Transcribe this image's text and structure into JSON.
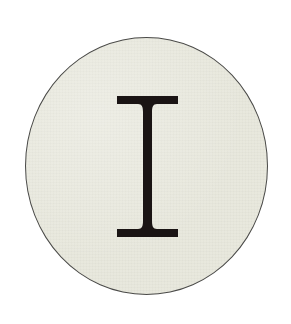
{
  "emblem": {
    "letter": "I",
    "shape": "circle",
    "colors": {
      "background": "#ffffff",
      "disc_fill": "#e8e8dc",
      "disc_border": "#4a4a48",
      "letter": "#1a1414"
    }
  }
}
